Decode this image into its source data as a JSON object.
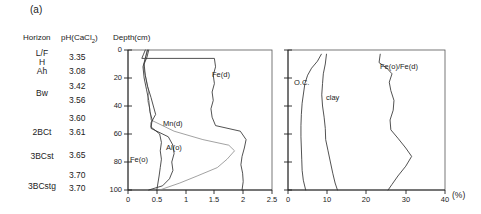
{
  "figure": {
    "panel_label": "(a)",
    "headers": {
      "horizon": "Horizon",
      "ph": "pH(CaCl",
      "ph_sub": "2",
      "ph_close": ")",
      "depth": "Depth(cm)"
    },
    "percent_unit": "(%)"
  },
  "profile": {
    "horizons": [
      {
        "label": "L/F",
        "depth_cm": 0
      },
      {
        "label": "H",
        "depth_cm": 4
      },
      {
        "label": "Ah",
        "depth_cm": 9
      },
      {
        "label": "Bw",
        "depth_cm": 25
      },
      {
        "label": "2BCt",
        "depth_cm": 55
      },
      {
        "label": "3BCst",
        "depth_cm": 73
      },
      {
        "label": "3BCstg",
        "depth_cm": 95
      }
    ],
    "ph_values": [
      "3.35",
      "3.08",
      "3.42",
      "3.56",
      "3.60",
      "3.61",
      "3.65",
      "3.70",
      "3.70"
    ]
  },
  "chart_data": [
    {
      "type": "line",
      "title": "",
      "xlabel": "",
      "ylabel": "Depth(cm)",
      "xlim": [
        0,
        2.5
      ],
      "ylim": [
        0,
        100
      ],
      "y_inverted": true,
      "grid": false,
      "legend": "inline-annotations",
      "xticks": [
        "0",
        "0.5",
        "1",
        "1.5",
        "2",
        "2.5"
      ],
      "yticks": [
        "0",
        "20",
        "40",
        "60",
        "80",
        "100"
      ],
      "series": [
        {
          "name": "Fe(d)",
          "label_x": 1.6,
          "label_depth": 17,
          "points": [
            [
              0.3,
              0
            ],
            [
              0.27,
              3
            ],
            [
              0.24,
              6
            ],
            [
              1.5,
              6
            ],
            [
              1.52,
              12
            ],
            [
              1.48,
              18
            ],
            [
              1.5,
              24
            ],
            [
              1.46,
              30
            ],
            [
              1.48,
              36
            ],
            [
              1.44,
              42
            ],
            [
              1.46,
              48
            ],
            [
              1.52,
              54
            ],
            [
              1.95,
              58
            ],
            [
              2.05,
              64
            ],
            [
              2.02,
              70
            ],
            [
              1.98,
              76
            ],
            [
              1.96,
              82
            ],
            [
              1.99,
              88
            ],
            [
              2.0,
              94
            ],
            [
              1.98,
              100
            ]
          ]
        },
        {
          "name": "Mn(d)",
          "label_x": 0.95,
          "label_depth": 55,
          "points": [
            [
              0.33,
              0
            ],
            [
              0.3,
              6
            ],
            [
              0.27,
              12
            ],
            [
              0.3,
              18
            ],
            [
              0.33,
              24
            ],
            [
              0.36,
              30
            ],
            [
              0.34,
              36
            ],
            [
              0.38,
              42
            ],
            [
              0.4,
              50
            ],
            [
              0.8,
              58
            ],
            [
              1.3,
              64
            ],
            [
              1.75,
              68
            ],
            [
              1.85,
              72
            ],
            [
              1.72,
              78
            ],
            [
              1.55,
              84
            ],
            [
              1.2,
              90
            ],
            [
              0.9,
              95
            ],
            [
              0.55,
              100
            ]
          ]
        },
        {
          "name": "Al(o)",
          "label_x": 0.88,
          "label_depth": 78,
          "points": [
            [
              0.36,
              0
            ],
            [
              0.33,
              5
            ],
            [
              0.28,
              10
            ],
            [
              0.3,
              18
            ],
            [
              0.34,
              26
            ],
            [
              0.4,
              34
            ],
            [
              0.44,
              40
            ],
            [
              0.48,
              46
            ],
            [
              0.4,
              52
            ],
            [
              0.4,
              56
            ],
            [
              0.7,
              62
            ],
            [
              0.78,
              68
            ],
            [
              0.8,
              74
            ],
            [
              0.76,
              80
            ],
            [
              0.78,
              86
            ],
            [
              0.72,
              92
            ],
            [
              0.6,
              97
            ],
            [
              0.36,
              100
            ]
          ]
        },
        {
          "name": "Fe(o)",
          "label_x": 0.3,
          "label_depth": 82,
          "points": [
            [
              0.34,
              0
            ],
            [
              0.3,
              6
            ],
            [
              0.26,
              12
            ],
            [
              0.28,
              20
            ],
            [
              0.32,
              28
            ],
            [
              0.36,
              36
            ],
            [
              0.38,
              44
            ],
            [
              0.42,
              50
            ],
            [
              0.4,
              55
            ],
            [
              0.55,
              60
            ],
            [
              0.58,
              66
            ],
            [
              0.56,
              72
            ],
            [
              0.58,
              78
            ],
            [
              0.56,
              84
            ],
            [
              0.54,
              90
            ],
            [
              0.52,
              95
            ],
            [
              0.5,
              100
            ]
          ]
        }
      ]
    },
    {
      "type": "line",
      "title": "",
      "xlabel": "(%)",
      "ylabel": "",
      "xlim": [
        0,
        40
      ],
      "ylim": [
        0,
        100
      ],
      "y_inverted": true,
      "grid": false,
      "legend": "inline-annotations",
      "xticks": [
        "0",
        "10",
        "20",
        "30",
        "40"
      ],
      "yticks": [
        "0",
        "20",
        "40",
        "60",
        "80",
        "100"
      ],
      "series": [
        {
          "name": "O.C.",
          "label_x": 1.5,
          "label_depth": 19,
          "points": [
            [
              8.5,
              3
            ],
            [
              7.5,
              8
            ],
            [
              6.0,
              13
            ],
            [
              5.0,
              18
            ],
            [
              4.3,
              24
            ],
            [
              4.0,
              30
            ],
            [
              3.6,
              38
            ],
            [
              3.4,
              46
            ],
            [
              3.3,
              54
            ],
            [
              3.3,
              62
            ],
            [
              3.4,
              70
            ],
            [
              3.5,
              78
            ],
            [
              3.6,
              86
            ],
            [
              3.9,
              93
            ],
            [
              4.5,
              100
            ]
          ]
        },
        {
          "name": "clay",
          "label_x": 7.5,
          "label_depth": 27,
          "points": [
            [
              9.8,
              3
            ],
            [
              9.5,
              10
            ],
            [
              9.0,
              17
            ],
            [
              8.8,
              24
            ],
            [
              8.6,
              32
            ],
            [
              8.8,
              40
            ],
            [
              9.2,
              48
            ],
            [
              9.5,
              56
            ],
            [
              9.6,
              64
            ],
            [
              10.2,
              72
            ],
            [
              10.8,
              80
            ],
            [
              11.4,
              88
            ],
            [
              12.0,
              95
            ],
            [
              12.6,
              100
            ]
          ]
        },
        {
          "name": "Fe(o)/Fe(d)",
          "label_x": 25.5,
          "label_depth": 10,
          "points": [
            [
              23.5,
              3
            ],
            [
              23.2,
              9
            ],
            [
              25.2,
              13
            ],
            [
              26.5,
              17
            ],
            [
              25.8,
              23
            ],
            [
              26.2,
              29
            ],
            [
              27.0,
              36
            ],
            [
              26.8,
              43
            ],
            [
              26.0,
              50
            ],
            [
              26.2,
              57
            ],
            [
              28.0,
              63
            ],
            [
              30.0,
              70
            ],
            [
              31.5,
              76
            ],
            [
              30.0,
              83
            ],
            [
              28.0,
              90
            ],
            [
              26.5,
              96
            ],
            [
              25.5,
              100
            ]
          ]
        }
      ]
    }
  ]
}
